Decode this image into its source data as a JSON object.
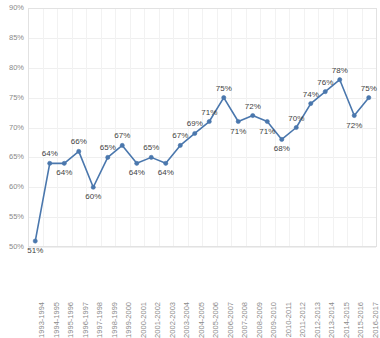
{
  "chart_data": {
    "type": "line",
    "title": "",
    "subtitle": "",
    "xlabel": "",
    "ylabel": "",
    "legend": [],
    "legend_position": "none",
    "grid": true,
    "ylim": [
      50,
      90
    ],
    "ytick_step": 5,
    "yticks": [
      "50%",
      "55%",
      "60%",
      "65%",
      "70%",
      "75%",
      "80%",
      "85%",
      "90%"
    ],
    "ytick_values": [
      50,
      55,
      60,
      65,
      70,
      75,
      80,
      85,
      90
    ],
    "categories": [
      "1993-1994",
      "1994-1995",
      "1995-1996",
      "1996-1997",
      "1997-1998",
      "1998-1999",
      "1999-2000",
      "2000-2001",
      "2001-2002",
      "2002-2003",
      "2003-2004",
      "2004-2005",
      "2005-2006",
      "2006-2007",
      "2007-2008",
      "2008-2009",
      "2009-2010",
      "2010-2011",
      "2011-2012",
      "2012-2013",
      "2013-2014",
      "2014-2015",
      "2015-2016",
      "2016-2017"
    ],
    "values": [
      51,
      64,
      64,
      66,
      60,
      65,
      67,
      64,
      65,
      64,
      67,
      69,
      71,
      75,
      71,
      72,
      71,
      68,
      70,
      74,
      76,
      78,
      72,
      75
    ],
    "point_labels": [
      "51%",
      "64%",
      "64%",
      "66%",
      "60%",
      "65%",
      "67%",
      "64%",
      "65%",
      "64%",
      "67%",
      "69%",
      "71%",
      "75%",
      "71%",
      "72%",
      "71%",
      "68%",
      "70%",
      "74%",
      "76%",
      "78%",
      "72%",
      "75%"
    ],
    "label_placement": [
      "below",
      "above",
      "below",
      "above",
      "below",
      "above",
      "above",
      "below",
      "above",
      "below",
      "above",
      "above",
      "above",
      "above",
      "below",
      "above",
      "below",
      "below",
      "above",
      "above",
      "above",
      "above",
      "below",
      "above"
    ],
    "series_color": "#4A77AD",
    "gridline_color": "#efefef",
    "tick_label_color": "#8a8a8a",
    "data_label_color": "#3f3f3f",
    "background_color": "#ffffff"
  }
}
